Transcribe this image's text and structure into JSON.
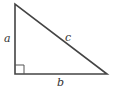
{
  "diagram": {
    "type": "right-triangle",
    "labels": {
      "side_a": "a",
      "side_b": "b",
      "hypotenuse_c": "c"
    },
    "right_angle_marker": true,
    "colors": {
      "stroke": "#444444",
      "background": "#ffffff"
    }
  }
}
